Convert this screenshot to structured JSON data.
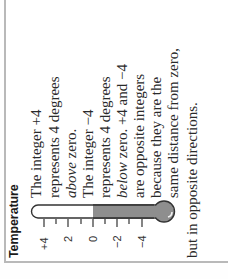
{
  "title": "Temperature",
  "thermometer": {
    "fill_color": "#8e8e8e",
    "empty_color": "#ffffff",
    "outline_color": "#333333",
    "ticks": [
      "+4",
      "2",
      "0",
      "−2",
      "−4"
    ],
    "reading": "0 to −4 shaded"
  },
  "text": {
    "l1": "The integer +4",
    "l2": "represents 4 degrees",
    "l3_em": "above",
    "l3_rest": " zero.",
    "l4": "The integer −4",
    "l5": "represents 4 degrees",
    "l6_em": "below",
    "l6_rest": " zero. +4 and −4",
    "l7": "are opposite integers",
    "l8": "because they are the",
    "l9": "same distance from zero,",
    "l10": "but in opposite directions."
  }
}
